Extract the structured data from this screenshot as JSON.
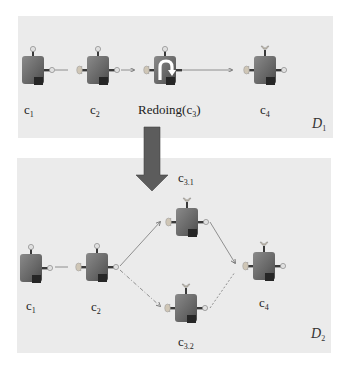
{
  "diagram": {
    "colors": {
      "panel_bg": "#ebebeb",
      "component_body": "#6e6e6e",
      "component_corner": "#2a2a2a",
      "port_provided": "#d8d8d8",
      "port_required": "#c9c0b0",
      "arrow": "#555555",
      "connector": "#7a7a7a"
    },
    "panels": [
      {
        "id": "D1",
        "label": "D",
        "label_sub": "1",
        "components": [
          {
            "name": "c",
            "sub": "1"
          },
          {
            "name": "c",
            "sub": "2"
          },
          {
            "name": "Redoing(c",
            "sub": "3",
            "suffix": ")",
            "icon": "redo-icon"
          },
          {
            "name": "c",
            "sub": "4"
          }
        ]
      },
      {
        "id": "D2",
        "label": "D",
        "label_sub": "2",
        "components": [
          {
            "name": "c",
            "sub": "1"
          },
          {
            "name": "c",
            "sub": "2"
          },
          {
            "name": "c",
            "sub": "3.1"
          },
          {
            "name": "c",
            "sub": "3.2"
          },
          {
            "name": "c",
            "sub": "4"
          }
        ]
      }
    ],
    "transition_arrow": "down-arrow"
  }
}
